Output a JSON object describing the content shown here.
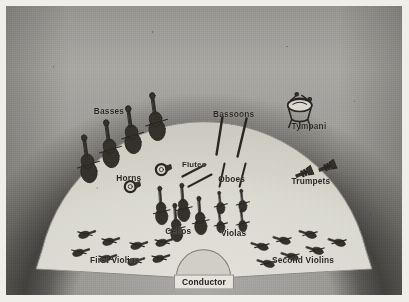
{
  "figure": {
    "kind": "orchestra-seating-chart",
    "colors": {
      "stage": "#d7d5cc",
      "backdrop_dark": "#4a4744",
      "ink": "#2a2723",
      "paper_margin": "#efeee9",
      "conductor_box_fill": "#e4e2da"
    }
  },
  "conductor": {
    "label": "Conductor"
  },
  "sections": [
    {
      "id": "basses",
      "label": "Basses",
      "label_x": 26.0,
      "label_y": 36.5,
      "count": 4,
      "icon": "double-bass-icon"
    },
    {
      "id": "horns",
      "label": "Horns",
      "label_x": 31.0,
      "label_y": 59.5,
      "count": 2,
      "icon": "french-horn-icon"
    },
    {
      "id": "flutes",
      "label": "Flutes",
      "label_x": 47.5,
      "label_y": 54.5,
      "count": 2,
      "icon": "flute-icon"
    },
    {
      "id": "cellos",
      "label": "Cellos",
      "label_x": 43.5,
      "label_y": 78.0,
      "count": 4,
      "icon": "cello-icon"
    },
    {
      "id": "first-violins",
      "label": "First Violins",
      "label_x": 27.5,
      "label_y": 88.0,
      "count": 8,
      "icon": "violin-icon"
    },
    {
      "id": "bassoons",
      "label": "Bassoons",
      "label_x": 57.5,
      "label_y": 37.5,
      "count": 2,
      "icon": "bassoon-icon"
    },
    {
      "id": "oboes",
      "label": "Oboes",
      "label_x": 57.0,
      "label_y": 60.0,
      "count": 2,
      "icon": "oboe-icon"
    },
    {
      "id": "violas",
      "label": "Violas",
      "label_x": 57.5,
      "label_y": 78.5,
      "count": 4,
      "icon": "viola-icon"
    },
    {
      "id": "second-violins",
      "label": "Second Violins",
      "label_x": 75.0,
      "label_y": 88.0,
      "count": 7,
      "icon": "violin-icon"
    },
    {
      "id": "tympani",
      "label": "Tympani",
      "label_x": 76.5,
      "label_y": 41.5,
      "count": 1,
      "icon": "timpani-icon"
    },
    {
      "id": "trumpets",
      "label": "Trumpets",
      "label_x": 77.0,
      "label_y": 60.5,
      "count": 2,
      "icon": "trumpet-icon"
    }
  ]
}
